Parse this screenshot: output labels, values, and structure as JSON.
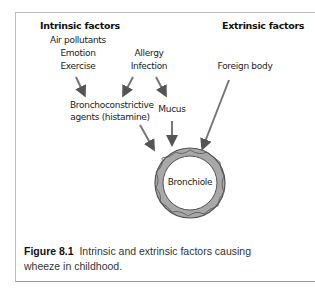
{
  "headings": {
    "intrinsic": "Intrinsic factors",
    "extrinsic": "Extrinsic factors"
  },
  "intrinsic_factors": [
    "Air pollutants",
    "Emotion",
    "Exercise"
  ],
  "allergy_group": [
    "Allergy",
    "Infection"
  ],
  "extrinsic_factors": [
    "Foreign body"
  ],
  "intermediates": {
    "agents_line1": "Bronchoconstrictive",
    "agents_line2": "agents (histamine)",
    "mucus": "Mucus"
  },
  "target": "Bronchiole",
  "caption": {
    "label": "Figure 8.1",
    "text": "Intrinsic and extrinsic factors causing wheeze in childhood."
  },
  "colors": {
    "ring_fill": "#a8a8a8",
    "ring_stroke": "#555555",
    "arrow": "#6a6a6a",
    "frame": "#bdbdbd"
  },
  "edges": [
    {
      "from": "Intrinsic factors",
      "to": "Bronchoconstrictive agents (histamine)"
    },
    {
      "from": "Allergy / Infection",
      "to": "Bronchoconstrictive agents (histamine)"
    },
    {
      "from": "Allergy / Infection",
      "to": "Mucus"
    },
    {
      "from": "Bronchoconstrictive agents (histamine)",
      "to": "Bronchiole"
    },
    {
      "from": "Mucus",
      "to": "Bronchiole"
    },
    {
      "from": "Foreign body",
      "to": "Bronchiole"
    }
  ]
}
